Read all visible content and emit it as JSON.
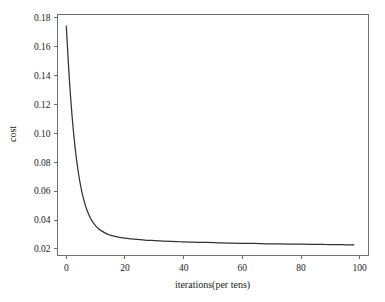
{
  "chart_data": {
    "type": "line",
    "title": "",
    "xlabel": "iterations(per tens)",
    "ylabel": "cost",
    "xlim": [
      -3,
      103
    ],
    "ylim": [
      0.0155,
      0.182
    ],
    "grid": false,
    "legend": null,
    "xticks": [
      0,
      20,
      40,
      60,
      80,
      100
    ],
    "xtick_labels": [
      "0",
      "20",
      "40",
      "60",
      "80",
      "100"
    ],
    "yticks": [
      0.02,
      0.04,
      0.06,
      0.08,
      0.1,
      0.12,
      0.14,
      0.16,
      0.18
    ],
    "ytick_labels": [
      "0.02",
      "0.04",
      "0.06",
      "0.08",
      "0.10",
      "0.12",
      "0.14",
      "0.16",
      "0.18"
    ],
    "series": [
      {
        "name": "cost",
        "color": "#333333",
        "x": [
          0,
          1,
          2,
          3,
          4,
          5,
          6,
          7,
          8,
          9,
          10,
          11,
          12,
          13,
          14,
          15,
          16,
          17,
          18,
          19,
          20,
          22,
          24,
          26,
          28,
          30,
          33,
          36,
          39,
          42,
          45,
          48,
          52,
          56,
          60,
          64,
          68,
          72,
          76,
          80,
          84,
          88,
          92,
          95,
          98
        ],
        "y": [
          0.174,
          0.1385,
          0.111,
          0.09,
          0.0742,
          0.0624,
          0.0536,
          0.0471,
          0.0423,
          0.0387,
          0.036,
          0.034,
          0.0325,
          0.0313,
          0.0303,
          0.0296,
          0.029,
          0.0285,
          0.0281,
          0.0278,
          0.0275,
          0.027,
          0.0266,
          0.0263,
          0.026,
          0.0258,
          0.0255,
          0.0252,
          0.025,
          0.0248,
          0.0246,
          0.0245,
          0.0243,
          0.0241,
          0.0239,
          0.0238,
          0.0236,
          0.0235,
          0.0234,
          0.0233,
          0.0232,
          0.0231,
          0.023,
          0.0229,
          0.0228
        ]
      }
    ]
  },
  "axes": {
    "x_title": "iterations(per tens)",
    "y_title": "cost"
  },
  "colors": {
    "curve": "#333333",
    "frame": "#6f6f6f",
    "background": "#ffffff",
    "text": "#1a1a1a"
  }
}
